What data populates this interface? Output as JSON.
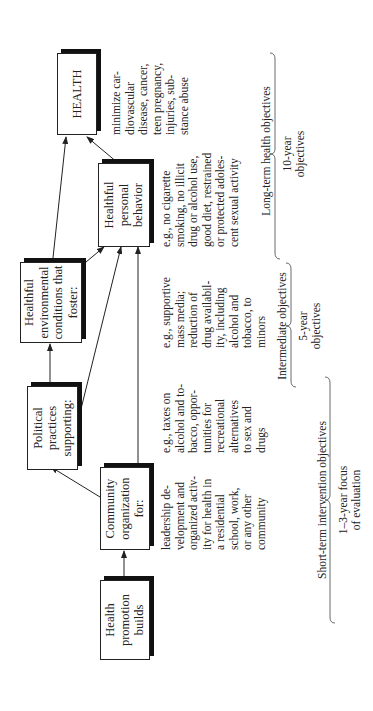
{
  "boxes": {
    "health_promotion": "Health promotion builds",
    "community_org": "Community organization for:",
    "political": "Political practices supporting:",
    "environmental": "Healthful environmental conditions that foster:",
    "personal_behavior": "Healthful personal behavior",
    "health": "HEALTH"
  },
  "descriptions": {
    "community_org": "leadership de-\nvelopment and\norganized activ-\nity for health in\na residential\nschool, work,\nor any other\ncommunity",
    "political": "e.g., taxes on\nalcohol and to-\nbacco, oppor-\ntunities for\nrecreational\nalternatives\nto sex and\ndrugs",
    "environmental": "e.g., supportive\nmass media;\nreduction of\ndrug availabil-\nity, including\nalcohol and\ntobacco, to\nminors",
    "personal_behavior": "e.g., no cigarette\nsmoking, no illicit\ndrug or alcohol use,\ngood diet, restrained\nor protected adoles-\ncent sexual activity",
    "health": "minimize car-\ndiovascular\ndisease, cancer,\nteen pregnancy,\ninjuries, sub-\nstance abuse"
  },
  "timeline": {
    "short_term_label": "Short-term intervention objectives",
    "short_term_sub": "1–3-year focus\nof evaluation",
    "intermediate_label": "Intermediate objectives",
    "intermediate_sub": "5-year\nobjectives",
    "long_term_label": "Long-term health objectives",
    "long_term_sub": "10-year\nobjectives"
  }
}
